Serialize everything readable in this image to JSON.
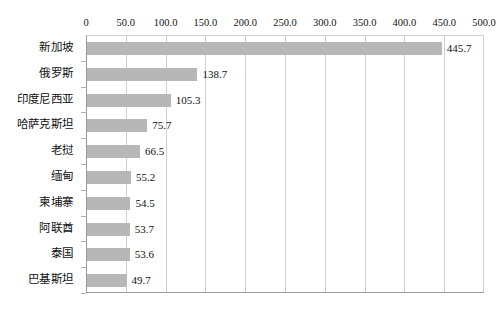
{
  "chart_data": {
    "type": "bar",
    "orientation": "horizontal",
    "title": "",
    "subtitle": "",
    "xlabel": "",
    "ylabel": "",
    "xlim": [
      0,
      500
    ],
    "xticks": [
      "0",
      "50.0",
      "100.0",
      "150.0",
      "200.0",
      "250.0",
      "300.0",
      "350.0",
      "400.0",
      "450.0",
      "500.0"
    ],
    "xtick_values": [
      0,
      50,
      100,
      150,
      200,
      250,
      300,
      350,
      400,
      450,
      500
    ],
    "grid": "vertical",
    "legend": "none",
    "categories": [
      "新加坡",
      "俄罗斯",
      "印度尼西亚",
      "哈萨克斯坦",
      "老挝",
      "缅甸",
      "柬埔寨",
      "阿联酋",
      "泰国",
      "巴基斯坦"
    ],
    "values": [
      445.7,
      138.7,
      105.3,
      75.7,
      66.5,
      55.2,
      54.5,
      53.7,
      53.6,
      49.7
    ],
    "data_labels": [
      "445.7",
      "138.7",
      "105.3",
      "75.7",
      "66.5",
      "55.2",
      "54.5",
      "53.7",
      "53.6",
      "49.7"
    ],
    "series": [
      {
        "name": "",
        "values": [
          445.7,
          138.7,
          105.3,
          75.7,
          66.5,
          55.2,
          54.5,
          53.7,
          53.6,
          49.7
        ]
      }
    ],
    "colors": {
      "bar_fill": "#b7b7b7",
      "gridline": "#cfcfcf",
      "axis": "#9a9a9a",
      "text": "#111111",
      "background": "#ffffff"
    }
  }
}
